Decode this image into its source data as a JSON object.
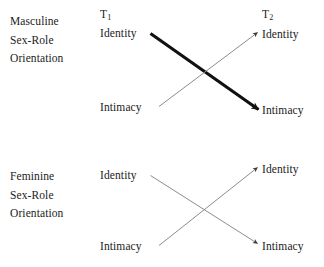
{
  "figure": {
    "background_color": "#ffffff",
    "text_color": "#1c1c1c",
    "thick_line_color": "#111111",
    "thin_line_color": "#8c8c8c"
  },
  "panels": [
    {
      "id": "masculine",
      "group_label_lines": [
        "Masculine",
        "Sex-Role",
        "Orientation"
      ],
      "time_labels": {
        "t1_prefix": "T",
        "t1_sub": "1",
        "t2_prefix": "T",
        "t2_sub": "2"
      },
      "nodes": {
        "t1_identity": "Identity",
        "t1_intimacy": "Intimacy",
        "t2_identity": "Identity",
        "t2_intimacy": "Intimacy"
      },
      "paths": [
        {
          "name": "identity-to-intimacy",
          "from": "t1_identity",
          "to": "t2_intimacy",
          "weight": "thick"
        },
        {
          "name": "intimacy-to-identity",
          "from": "t1_intimacy",
          "to": "t2_identity",
          "weight": "thin"
        }
      ]
    },
    {
      "id": "feminine",
      "group_label_lines": [
        "Feminine",
        "Sex-Role",
        "Orientation"
      ],
      "nodes": {
        "t1_identity": "Identity",
        "t1_intimacy": "Intimacy",
        "t2_identity": "Identity",
        "t2_intimacy": "Intimacy"
      },
      "paths": [
        {
          "name": "identity-to-intimacy",
          "from": "t1_identity",
          "to": "t2_intimacy",
          "weight": "thin"
        },
        {
          "name": "intimacy-to-identity",
          "from": "t1_intimacy",
          "to": "t2_identity",
          "weight": "thin"
        }
      ]
    }
  ]
}
